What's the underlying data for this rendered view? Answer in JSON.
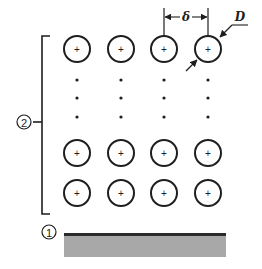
{
  "diagram": {
    "type": "particle-array-above-substrate",
    "labels": {
      "spacing_symbol": "δ",
      "diameter_symbol": "D",
      "array_marker": "2",
      "substrate_marker": "1"
    },
    "particle_glyph": "+",
    "grid": {
      "columns_x": [
        77,
        121,
        164,
        208
      ],
      "particle_rows_y": [
        49,
        153,
        193
      ],
      "ellipsis_rows_y": [
        80,
        98,
        117
      ],
      "particle_radius": 13
    },
    "colors": {
      "ink": "#1e1e1e",
      "substrate_fill": "#a8a8a8",
      "substrate_top": "#2a2a2a",
      "background": "#ffffff"
    }
  }
}
